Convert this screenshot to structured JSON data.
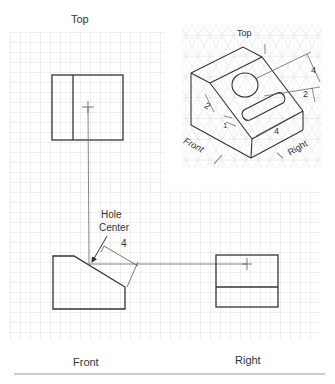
{
  "figure": {
    "views": {
      "top": {
        "label": "Top"
      },
      "front": {
        "label": "Front"
      },
      "right": {
        "label": "Right"
      }
    },
    "annotations": {
      "hole_center_line1": "Hole",
      "hole_center_line2": "Center",
      "front_dimension": "4"
    },
    "isometric": {
      "label_top": "Top",
      "label_front": "Front",
      "label_right": "Right",
      "dim_4_right": "4",
      "dim_2_right": "2",
      "dim_2_left": "2",
      "dim_1": "1",
      "dim_4_bottom": "4"
    },
    "colors": {
      "grid": "#d8d8d8",
      "line": "#333333",
      "dim_line": "#555555",
      "arrow_gray": "#9a9a9a",
      "rule": "#999999"
    }
  }
}
